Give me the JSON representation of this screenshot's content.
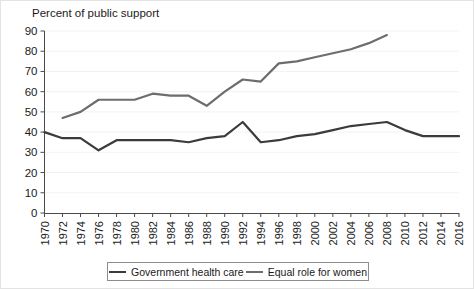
{
  "axis_title": "Percent of public support",
  "legend": {
    "items": [
      {
        "label": "Government health care",
        "color": "#3b3b3b",
        "swatch": "line-swatch-health"
      },
      {
        "label": "Equal role for women",
        "color": "#6d6d6d",
        "swatch": "line-swatch-equal"
      }
    ]
  },
  "chart_data": {
    "type": "line",
    "title": "",
    "subtitle": "",
    "xlabel": "",
    "ylabel": "Percent of public support",
    "ylim": [
      0,
      90
    ],
    "ytick_step": 10,
    "yticks": [
      0,
      10,
      20,
      30,
      40,
      50,
      60,
      70,
      80,
      90
    ],
    "grid": true,
    "grid_axis": "y",
    "legend_position": "bottom",
    "x": [
      1970,
      1972,
      1974,
      1976,
      1978,
      1980,
      1982,
      1984,
      1986,
      1988,
      1990,
      1992,
      1994,
      1996,
      1998,
      2000,
      2002,
      2004,
      2006,
      2008,
      2010,
      2012,
      2014,
      2016
    ],
    "xtick_labels": [
      "1970",
      "1972",
      "1974",
      "1976",
      "1978",
      "1980",
      "1982",
      "1984",
      "1986",
      "1988",
      "1990",
      "1992",
      "1994",
      "1996",
      "1998",
      "2000",
      "2002",
      "2004",
      "2006",
      "2008",
      "2010",
      "2012",
      "2014",
      "2016"
    ],
    "xtick_rotation": 90,
    "series": [
      {
        "name": "Government health care",
        "color": "#3b3b3b",
        "x": [
          1970,
          1972,
          1974,
          1976,
          1978,
          1980,
          1982,
          1984,
          1986,
          1988,
          1990,
          1992,
          1994,
          1996,
          1998,
          2000,
          2002,
          2004,
          2006,
          2008,
          2010,
          2012,
          2014,
          2016
        ],
        "values": [
          40,
          37,
          37,
          31,
          36,
          36,
          36,
          36,
          35,
          37,
          38,
          45,
          35,
          36,
          38,
          39,
          41,
          43,
          44,
          45,
          41,
          38,
          38,
          38
        ]
      },
      {
        "name": "Equal role for women",
        "color": "#6d6d6d",
        "x": [
          1972,
          1974,
          1976,
          1978,
          1980,
          1982,
          1984,
          1986,
          1988,
          1990,
          1992,
          1994,
          1996,
          1998,
          2000,
          2002,
          2004,
          2006,
          2008
        ],
        "values": [
          47,
          50,
          56,
          56,
          56,
          59,
          58,
          58,
          53,
          60,
          66,
          65,
          74,
          75,
          77,
          79,
          81,
          84,
          88
        ]
      }
    ]
  }
}
